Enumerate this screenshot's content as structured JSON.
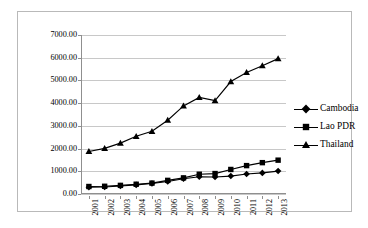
{
  "chart_data": {
    "type": "line",
    "title": "",
    "subtitle": "",
    "xlabel": "",
    "ylabel": "",
    "categories": [
      "2001",
      "2002",
      "2003",
      "2004",
      "2005",
      "2006",
      "2007",
      "2008",
      "2009",
      "2010",
      "2011",
      "2012",
      "2013"
    ],
    "ylim": [
      0,
      7000
    ],
    "ytick_labels": [
      "0.00",
      "1000.00",
      "2000.00",
      "3000.00",
      "4000.00",
      "5000.00",
      "6000.00",
      "7000.00"
    ],
    "ytick_values": [
      0,
      1000,
      2000,
      3000,
      4000,
      5000,
      6000,
      7000
    ],
    "grid": true,
    "legend_position": "right",
    "series": [
      {
        "name": "Cambodia",
        "marker": "diamond",
        "color": "#000000",
        "values": [
          300,
          310,
          350,
          400,
          460,
          550,
          670,
          760,
          750,
          790,
          880,
          930,
          1010
        ]
      },
      {
        "name": "Lao PDR",
        "marker": "square",
        "color": "#000000",
        "values": [
          330,
          340,
          380,
          430,
          480,
          600,
          710,
          870,
          900,
          1080,
          1250,
          1380,
          1490
        ]
      },
      {
        "name": "Thailand",
        "marker": "triangle",
        "color": "#000000",
        "values": [
          1870,
          2010,
          2240,
          2540,
          2760,
          3250,
          3880,
          4250,
          4110,
          4950,
          5350,
          5650,
          5960
        ]
      }
    ]
  },
  "legend": {
    "items": [
      {
        "label": "Cambodia",
        "marker": "diamond-marker"
      },
      {
        "label": "Lao PDR",
        "marker": "square-marker"
      },
      {
        "label": "Thailand",
        "marker": "triangle-marker"
      }
    ]
  },
  "colors": {
    "series": "#000000",
    "gridline": "#c8c8c8",
    "axis": "#8f8f8f",
    "frame": "#b9b9b9",
    "background": "#ffffff"
  }
}
